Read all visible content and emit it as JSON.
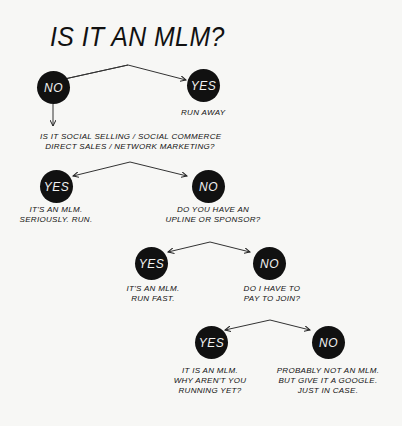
{
  "title": "IS IT AN MLM?",
  "nodes": {
    "q1_no": "NO",
    "q1_yes": "YES",
    "q2_yes": "YES",
    "q2_no": "NO",
    "q3_yes": "YES",
    "q3_no": "NO",
    "q4_yes": "YES",
    "q4_no": "NO"
  },
  "texts": {
    "q1_yes_result": "RUN AWAY",
    "q2_question_line1": "IS IT SOCIAL SELLING / SOCIAL COMMERCE",
    "q2_question_line2": "DIRECT SALES / NETWORK MARKETING?",
    "q2_yes_result_line1": "IT'S AN MLM.",
    "q2_yes_result_line2": "SERIOUSLY. RUN.",
    "q3_question_line1": "DO YOU HAVE AN",
    "q3_question_line2": "UPLINE OR SPONSOR?",
    "q3_yes_result_line1": "IT'S AN MLM.",
    "q3_yes_result_line2": "RUN FAST.",
    "q4_question_line1": "DO I HAVE TO",
    "q4_question_line2": "PAY TO JOIN?",
    "q4_yes_result_line1": "IT IS AN MLM.",
    "q4_yes_result_line2": "WHY AREN'T YOU",
    "q4_yes_result_line3": "RUNNING YET?",
    "q4_no_result_line1": "PROBABLY NOT AN MLM.",
    "q4_no_result_line2": "BUT GIVE IT A GOOGLE.",
    "q4_no_result_line3": "JUST IN CASE."
  },
  "colors": {
    "background": "#f7f7f5",
    "node_fill": "#111111",
    "node_text": "#f2f2f2",
    "ink": "#111111"
  }
}
